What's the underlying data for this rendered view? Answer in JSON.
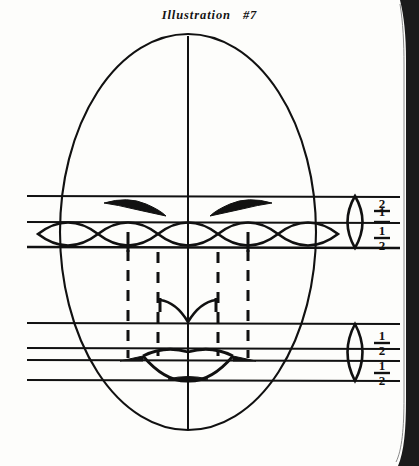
{
  "page": {
    "width": 419,
    "height": 466,
    "background": "#fdfdfb",
    "ink": "#111111",
    "title": "Illustration   #7",
    "cut_off_top_line": "........",
    "scan_edge_color": "#1a1a1a"
  },
  "diagram": {
    "head_oval": {
      "cx": 188,
      "cy": 232,
      "rx": 128,
      "ry": 198
    },
    "center_axis": {
      "x": 188,
      "y_top": 36,
      "y_bottom": 430
    },
    "guide_lines_extent": {
      "x_start": 27,
      "x_end": 400
    },
    "eye_zone": {
      "label": "eye level",
      "lines_y": [
        196,
        222,
        247
      ],
      "lens_count": 5,
      "lens_cx": [
        68,
        128,
        188,
        248,
        308
      ],
      "lens_rx": 30,
      "lens_ry": 12,
      "pupil_x": [
        128,
        248
      ],
      "eyebrow_y": 205
    },
    "mouth_zone": {
      "label": "nose and mouth level",
      "lines_y": [
        323,
        348,
        360,
        380
      ],
      "nose_y": 318,
      "mouth_cy": 362,
      "mouth_rx": 45
    },
    "dashed_guides": {
      "label": "vertical alignment guides from eyes to mouth",
      "x_positions": [
        128,
        158,
        218,
        248
      ],
      "y_top": 248,
      "y_bottom": 358
    },
    "right_scale_upper": {
      "lens_cx": 355,
      "lens_cy": 222,
      "lens_rx": 13,
      "lens_ry": 26,
      "fractions": [
        "1/2",
        "1/2"
      ],
      "fraction_numerator": "1",
      "fraction_denominator": "2",
      "fraction_x": 381,
      "upper_fraction_y": 211,
      "lower_fraction_y": 236
    },
    "right_scale_lower": {
      "lens_cx": 355,
      "lens_cy": 352,
      "lens_rx": 13,
      "lens_ry": 26,
      "fractions": [
        "1/2",
        "1/2"
      ],
      "fraction_x": 381,
      "upper_fraction_y": 338,
      "lower_fraction_y": 368
    }
  }
}
